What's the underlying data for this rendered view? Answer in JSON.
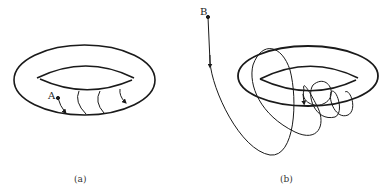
{
  "figure": {
    "panels": [
      {
        "id": "a",
        "caption": "(a)",
        "point_label": "A",
        "description": "Torus with flow lines from point A winding around the tube surface"
      },
      {
        "id": "b",
        "caption": "(b)",
        "point_label": "B",
        "description": "Trajectory from point B spiraling around and converging onto the torus"
      }
    ],
    "colors": {
      "stroke": "#1a1a1a",
      "background": "#ffffff"
    }
  }
}
